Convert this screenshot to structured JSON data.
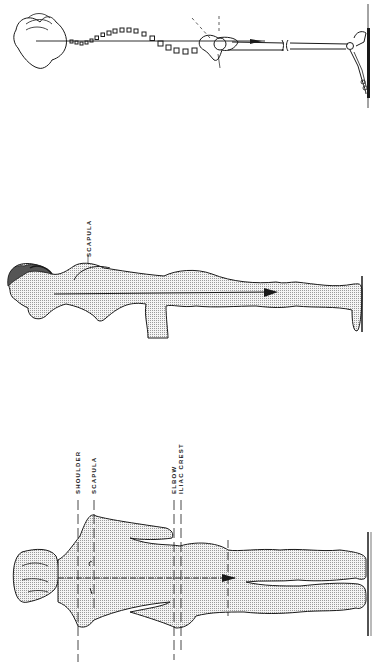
{
  "figure": {
    "orientation": "rotated-90-ccw",
    "panels": [
      {
        "id": "skeletal-side-view",
        "description": "Spine and pelvis line diagram with plumb line",
        "labels": []
      },
      {
        "id": "lateral-view",
        "description": "Side view of standing figure with plumb line",
        "labels": [
          "SCAPULA"
        ]
      },
      {
        "id": "posterior-view",
        "description": "Back view of standing figure with reference lines",
        "labels": [
          "SHOULDER",
          "SCAPULA",
          "ELBOW",
          "ILIAC CREST"
        ]
      }
    ]
  },
  "labels": {
    "lateral_scapula": "SCAPULA",
    "posterior_shoulder": "SHOULDER",
    "posterior_scapula": "SCAPULA",
    "posterior_elbow": "ELBOW",
    "posterior_iliac_crest": "ILIAC CREST"
  },
  "colors": {
    "ink": "#1a1a1a",
    "fill": "#dcdcdc",
    "background": "#ffffff"
  }
}
